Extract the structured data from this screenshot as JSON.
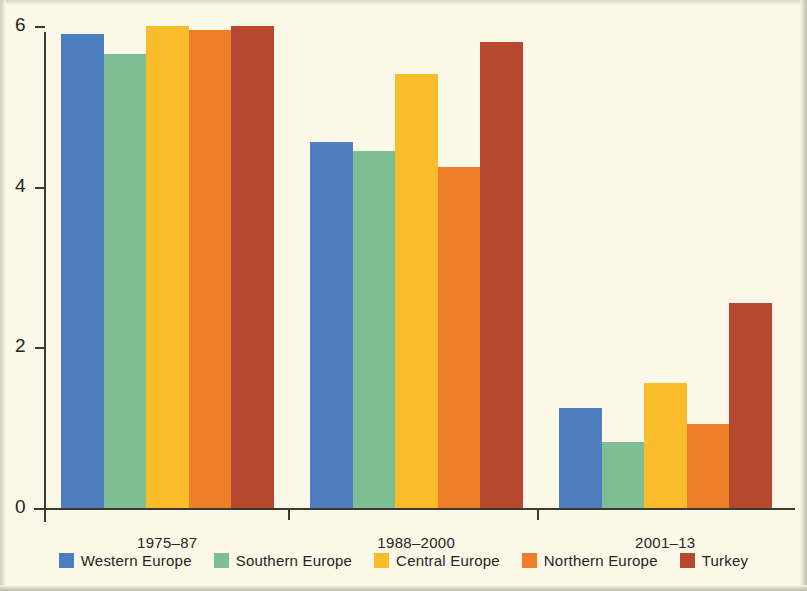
{
  "figure": {
    "background_color": "#fbf8e8",
    "axis_color": "#3b3a33",
    "text_color": "#26241f"
  },
  "chart_data": {
    "type": "bar",
    "title": "",
    "subtitle": "",
    "xlabel": "",
    "ylabel": "",
    "categories": [
      "1975–87",
      "1988–2000",
      "2001–13"
    ],
    "ylim": [
      0,
      6
    ],
    "yticks": [
      0,
      2,
      4,
      6
    ],
    "ytick_labels": [
      "0",
      "2",
      "4",
      "6"
    ],
    "grid": false,
    "legend_position": "bottom",
    "series": [
      {
        "name": "Western Europe",
        "color": "#4d7fc0",
        "values": [
          5.9,
          4.55,
          1.25
        ]
      },
      {
        "name": "Southern Europe",
        "color": "#7fbd93",
        "values": [
          5.65,
          4.45,
          0.82
        ]
      },
      {
        "name": "Central Europe",
        "color": "#fbbc2c",
        "values": [
          6.0,
          5.4,
          1.55
        ]
      },
      {
        "name": "Northern Europe",
        "color": "#ef7e28",
        "values": [
          5.95,
          4.25,
          1.05
        ]
      },
      {
        "name": "Turkey",
        "color": "#b5482f",
        "values": [
          6.0,
          5.8,
          2.55
        ]
      }
    ]
  }
}
